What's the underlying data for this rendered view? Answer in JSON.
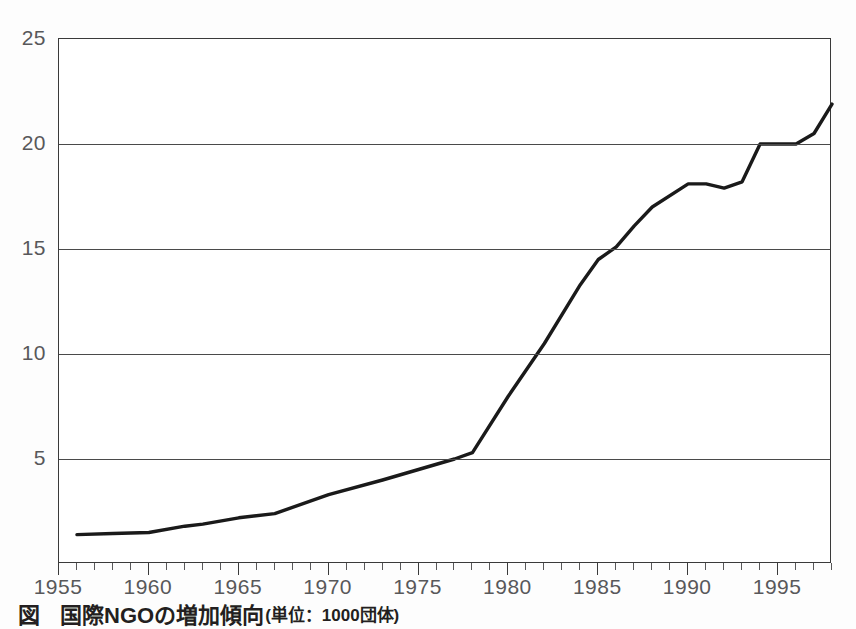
{
  "caption": {
    "marker": "図",
    "title": "国際NGOの増加傾向",
    "unit": "(単位：1000団体)"
  },
  "chart_data": {
    "type": "line",
    "title": "国際NGOの増加傾向",
    "xlabel": "",
    "ylabel": "",
    "unit": "1000団体",
    "xlim": [
      1955,
      1998
    ],
    "ylim": [
      0,
      25
    ],
    "grid": true,
    "legend": "none",
    "y_ticks": [
      5,
      10,
      15,
      20,
      25
    ],
    "x_ticks": [
      1955,
      1960,
      1965,
      1970,
      1975,
      1980,
      1985,
      1990,
      1995
    ],
    "x_minor_tick_step": 1,
    "line_color": "#1a1a1a",
    "x": [
      1956,
      1958,
      1960,
      1962,
      1963,
      1965,
      1967,
      1970,
      1973,
      1975,
      1977,
      1978,
      1980,
      1982,
      1984,
      1985,
      1986,
      1987,
      1988,
      1990,
      1991,
      1992,
      1993,
      1994,
      1995,
      1996,
      1997,
      1998
    ],
    "values": [
      1.4,
      1.45,
      1.5,
      1.8,
      1.9,
      2.2,
      2.4,
      3.3,
      4.0,
      4.5,
      5.0,
      5.3,
      8.0,
      10.5,
      13.3,
      14.5,
      15.1,
      16.1,
      17.0,
      18.1,
      18.1,
      17.9,
      18.2,
      20.0,
      20.0,
      20.0,
      20.5,
      21.9
    ],
    "series": [
      {
        "name": "国際NGO数",
        "values": [
          1.4,
          1.45,
          1.5,
          1.8,
          1.9,
          2.2,
          2.4,
          3.3,
          4.0,
          4.5,
          5.0,
          5.3,
          8.0,
          10.5,
          13.3,
          14.5,
          15.1,
          16.1,
          17.0,
          18.1,
          18.1,
          17.9,
          18.2,
          20.0,
          20.0,
          20.0,
          20.5,
          21.9
        ]
      }
    ]
  }
}
